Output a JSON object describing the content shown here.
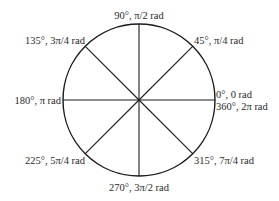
{
  "diagram": {
    "colors": {
      "stroke": "#1a1a1a",
      "text": "#2a2a2a",
      "background": "#ffffff"
    },
    "angles": [
      {
        "id": "a0",
        "degrees": 0,
        "lines": [
          "0°, 0 rad",
          "360°, 2π rad"
        ]
      },
      {
        "id": "a45",
        "degrees": 45,
        "lines": [
          "45°, π/4 rad"
        ]
      },
      {
        "id": "a90",
        "degrees": 90,
        "lines": [
          "90°, π/2 rad"
        ]
      },
      {
        "id": "a135",
        "degrees": 135,
        "lines": [
          "135°, 3π/4 rad"
        ]
      },
      {
        "id": "a180",
        "degrees": 180,
        "lines": [
          "180°, π rad"
        ]
      },
      {
        "id": "a225",
        "degrees": 225,
        "lines": [
          "225°, 5π/4 rad"
        ]
      },
      {
        "id": "a270",
        "degrees": 270,
        "lines": [
          "270°, 3π/2 rad"
        ]
      },
      {
        "id": "a315",
        "degrees": 315,
        "lines": [
          "315°, 7π/4 rad"
        ]
      }
    ]
  }
}
